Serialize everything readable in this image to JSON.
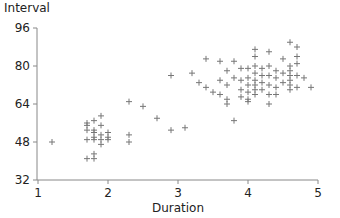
{
  "chart_data": {
    "type": "scatter",
    "title": "",
    "xlabel": "Duration",
    "ylabel": "Interval",
    "xlim": [
      1,
      5
    ],
    "ylim": [
      32,
      96
    ],
    "xticks": [
      1,
      2,
      3,
      4,
      5
    ],
    "yticks": [
      32,
      48,
      64,
      80,
      96
    ],
    "grid": false,
    "legend": null,
    "marker": "+",
    "marker_color": "#777777",
    "series": [
      {
        "name": "eruptions",
        "points": [
          [
            1.2,
            48
          ],
          [
            1.7,
            55
          ],
          [
            1.7,
            56
          ],
          [
            1.7,
            53
          ],
          [
            1.7,
            49
          ],
          [
            1.7,
            41
          ],
          [
            1.8,
            57
          ],
          [
            1.8,
            53
          ],
          [
            1.8,
            52
          ],
          [
            1.8,
            50
          ],
          [
            1.8,
            49
          ],
          [
            1.8,
            41
          ],
          [
            1.8,
            43
          ],
          [
            1.9,
            59
          ],
          [
            1.9,
            55
          ],
          [
            1.9,
            51
          ],
          [
            1.9,
            49
          ],
          [
            1.9,
            47
          ],
          [
            2.0,
            52
          ],
          [
            2.0,
            50
          ],
          [
            2.0,
            49
          ],
          [
            2.3,
            65
          ],
          [
            2.3,
            51
          ],
          [
            2.3,
            48
          ],
          [
            2.5,
            63
          ],
          [
            2.7,
            58
          ],
          [
            2.9,
            53
          ],
          [
            2.9,
            76
          ],
          [
            3.1,
            54
          ],
          [
            3.2,
            77
          ],
          [
            3.3,
            73
          ],
          [
            3.4,
            83
          ],
          [
            3.4,
            71
          ],
          [
            3.5,
            69
          ],
          [
            3.6,
            82
          ],
          [
            3.6,
            74
          ],
          [
            3.6,
            68
          ],
          [
            3.7,
            78
          ],
          [
            3.7,
            72
          ],
          [
            3.7,
            66
          ],
          [
            3.7,
            64
          ],
          [
            3.8,
            82
          ],
          [
            3.8,
            75
          ],
          [
            3.8,
            57
          ],
          [
            3.9,
            79
          ],
          [
            3.9,
            74
          ],
          [
            3.9,
            70
          ],
          [
            3.9,
            67
          ],
          [
            4.0,
            79
          ],
          [
            4.0,
            75
          ],
          [
            4.0,
            72
          ],
          [
            4.0,
            69
          ],
          [
            4.0,
            66
          ],
          [
            4.0,
            65
          ],
          [
            4.1,
            87
          ],
          [
            4.1,
            84
          ],
          [
            4.1,
            80
          ],
          [
            4.1,
            77
          ],
          [
            4.1,
            74
          ],
          [
            4.1,
            72
          ],
          [
            4.1,
            70
          ],
          [
            4.1,
            68
          ],
          [
            4.2,
            79
          ],
          [
            4.2,
            76
          ],
          [
            4.2,
            73
          ],
          [
            4.2,
            70
          ],
          [
            4.3,
            86
          ],
          [
            4.3,
            80
          ],
          [
            4.3,
            76
          ],
          [
            4.3,
            72
          ],
          [
            4.3,
            68
          ],
          [
            4.3,
            64
          ],
          [
            4.4,
            78
          ],
          [
            4.4,
            75
          ],
          [
            4.4,
            71
          ],
          [
            4.4,
            68
          ],
          [
            4.5,
            83
          ],
          [
            4.5,
            77
          ],
          [
            4.5,
            73
          ],
          [
            4.6,
            90
          ],
          [
            4.6,
            80
          ],
          [
            4.6,
            78
          ],
          [
            4.6,
            76
          ],
          [
            4.6,
            74
          ],
          [
            4.6,
            72
          ],
          [
            4.6,
            70
          ],
          [
            4.7,
            88
          ],
          [
            4.7,
            84
          ],
          [
            4.7,
            81
          ],
          [
            4.7,
            76
          ],
          [
            4.7,
            71
          ],
          [
            4.8,
            75
          ],
          [
            4.9,
            71
          ]
        ]
      }
    ]
  }
}
